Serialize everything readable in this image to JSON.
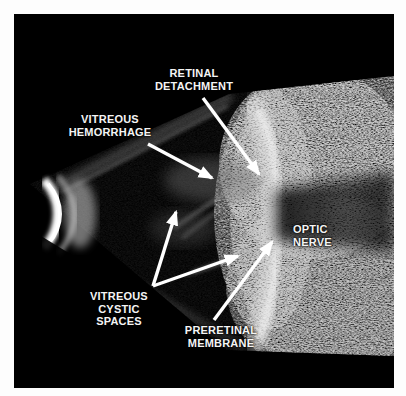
{
  "figure": {
    "modality": "B-scan ocular ultrasound",
    "background_color": "#000000",
    "page_color": "#ffffff",
    "label_color": "#f4f4f4",
    "arrow_color": "#ffffff"
  },
  "annotations": [
    {
      "id": "retinal-detachment",
      "text": "RETINAL\nDETACHMENT",
      "label_x": 132,
      "label_y": 53,
      "align": "center",
      "width": 96,
      "arrow": {
        "x1": 189,
        "y1": 84,
        "x2": 245,
        "y2": 160
      }
    },
    {
      "id": "vitreous-hemorrhage",
      "text": "VITREOUS\nHEMORRHAGE",
      "label_x": 44,
      "label_y": 99,
      "align": "center",
      "width": 104,
      "arrow": {
        "x1": 134,
        "y1": 130,
        "x2": 198,
        "y2": 164
      }
    },
    {
      "id": "optic-nerve",
      "text": "OPTIC\nNERVE",
      "label_x": 279,
      "label_y": 209,
      "align": "left",
      "width": 58,
      "arrow": null
    },
    {
      "id": "vitreous-cystic-spaces",
      "text": "VITREOUS\nCYSTIC\nSPACES",
      "label_x": 63,
      "label_y": 276,
      "align": "center",
      "width": 84,
      "arrow": null,
      "arrows": [
        {
          "x1": 139,
          "y1": 272,
          "x2": 162,
          "y2": 198
        },
        {
          "x1": 139,
          "y1": 272,
          "x2": 224,
          "y2": 242
        }
      ]
    },
    {
      "id": "preretinal-membrane",
      "text": "PRERETINAL\nMEMBRANE",
      "label_x": 157,
      "label_y": 310,
      "align": "center",
      "width": 100,
      "arrow": {
        "x1": 200,
        "y1": 306,
        "x2": 258,
        "y2": 228
      }
    }
  ]
}
